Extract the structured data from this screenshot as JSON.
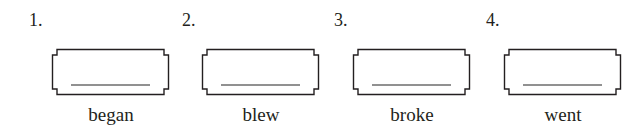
{
  "items": [
    {
      "number": "1.",
      "word": "began",
      "answer": ""
    },
    {
      "number": "2.",
      "word": "blew",
      "answer": ""
    },
    {
      "number": "3.",
      "word": "broke",
      "answer": ""
    },
    {
      "number": "4.",
      "word": "went",
      "answer": ""
    }
  ]
}
